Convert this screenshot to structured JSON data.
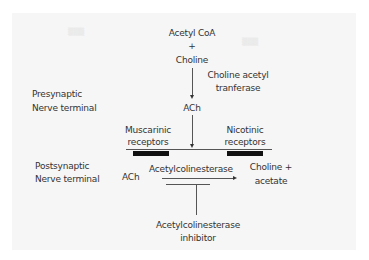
{
  "diagram": {
    "regions": {
      "presynaptic": {
        "line1": "Presynaptic",
        "line2": "Nerve terminal"
      },
      "postsynaptic": {
        "line1": "Postsynaptic",
        "line2": "Nerve terminal"
      }
    },
    "synthesis": {
      "substrate1": "Acetyl CoA",
      "plus": "+",
      "substrate2": "Choline",
      "enzyme_line1": "Choline acetyl",
      "enzyme_line2": "tranferase",
      "product": "ACh"
    },
    "receptors": {
      "muscarinic": {
        "line1": "Muscarinic",
        "line2": "receptors"
      },
      "nicotinic": {
        "line1": "Nicotinic",
        "line2": "receptors"
      }
    },
    "breakdown": {
      "substrate": "ACh",
      "enzyme": "Acetylcolinesterase",
      "product_line1": "Choline +",
      "product_line2": "acetate"
    },
    "inhibitor": {
      "line1": "Acetylcolinesterase",
      "line2": "inhibitor"
    },
    "colors": {
      "background": "#ffffff",
      "panel": "#f6f6f6",
      "text": "#333333",
      "lines": "#555555",
      "receptor_bars": "#111111"
    }
  }
}
